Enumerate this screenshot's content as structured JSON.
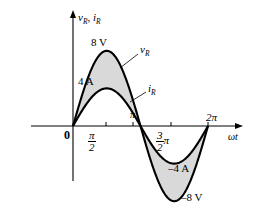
{
  "figure": {
    "background_color": "#ffffff",
    "line_color": "#000000",
    "fill_color": "#d9d9d9"
  },
  "axes": {
    "y_label": "v",
    "y_label_sub": "R",
    "y_label_2": "i",
    "y_label_2_sub": "R",
    "y_label_separator": ", ",
    "x_label": "ωt",
    "origin_label": "0"
  },
  "ticks": {
    "x": [
      {
        "label": "0",
        "value": 0
      },
      {
        "label": "π/2",
        "num": "π",
        "den": "2",
        "value": 1.5708
      },
      {
        "label": "π",
        "value": 3.1416
      },
      {
        "label": "3π/2",
        "num": "3",
        "den": "2",
        "suffix": "π",
        "value": 4.7124
      },
      {
        "label": "2π",
        "value": 6.2832
      }
    ]
  },
  "annotations": {
    "peak_voltage": "8 V",
    "peak_current": "4 A",
    "trough_current": "–4 A",
    "trough_voltage": "–8 V",
    "curve_voltage": "v",
    "curve_voltage_sub": "R",
    "curve_current": "i",
    "curve_current_sub": "R"
  },
  "chart_data": {
    "type": "line",
    "title": "",
    "xlabel": "ωt",
    "ylabel": "v_R, i_R",
    "xlim": [
      0,
      6.2832
    ],
    "ylim": [
      -9,
      9
    ],
    "grid": false,
    "legend": "inline-labels",
    "x_tick_values": [
      0,
      1.5708,
      3.1416,
      4.7124,
      6.2832
    ],
    "x_tick_labels": [
      "0",
      "π/2",
      "π",
      "3π/2",
      "2π"
    ],
    "shaded_between_series": true,
    "series": [
      {
        "name": "v_R",
        "unit": "V",
        "amplitude": 8,
        "phase": 0,
        "peak_label": "8 V",
        "trough_label": "–8 V",
        "x": [
          0,
          0.3927,
          0.7854,
          1.1781,
          1.5708,
          1.9635,
          2.3562,
          2.7489,
          3.1416,
          3.5343,
          3.927,
          4.3197,
          4.7124,
          5.1051,
          5.4978,
          5.8905,
          6.2832
        ],
        "values": [
          0,
          3.06,
          5.66,
          7.39,
          8,
          7.39,
          5.66,
          3.06,
          0,
          -3.06,
          -5.66,
          -7.39,
          -8,
          -7.39,
          -5.66,
          -3.06,
          0
        ]
      },
      {
        "name": "i_R",
        "unit": "A",
        "amplitude": 4,
        "phase": 0,
        "peak_label": "4 A",
        "trough_label": "–4 A",
        "x": [
          0,
          0.3927,
          0.7854,
          1.1781,
          1.5708,
          1.9635,
          2.3562,
          2.7489,
          3.1416,
          3.5343,
          3.927,
          4.3197,
          4.7124,
          5.1051,
          5.4978,
          5.8905,
          6.2832
        ],
        "values": [
          0,
          1.53,
          2.83,
          3.7,
          4,
          3.7,
          2.83,
          1.53,
          0,
          -1.53,
          -2.83,
          -3.7,
          -4,
          -3.7,
          -2.83,
          -1.53,
          0
        ]
      }
    ]
  }
}
